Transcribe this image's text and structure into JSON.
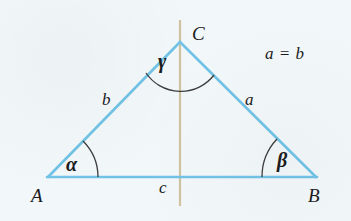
{
  "figure": {
    "type": "geometry-diagram",
    "background_color": "#f2f7fa"
  },
  "colors": {
    "triangle_stroke": "#71c3e6",
    "axis_stroke": "#cfc3a0",
    "arc_stroke": "#3d3d3d",
    "text": "#1c1c1c"
  },
  "vertices": [
    {
      "name": "A",
      "label": "A",
      "x": 48,
      "y": 177
    },
    {
      "name": "B",
      "label": "B",
      "x": 316,
      "y": 177
    },
    {
      "name": "C",
      "label": "C",
      "x": 180,
      "y": 42
    }
  ],
  "sides": [
    {
      "name": "side-a",
      "label": "a",
      "from": "C",
      "to": "B",
      "label_x": 250,
      "label_y": 100
    },
    {
      "name": "side-b",
      "label": "b",
      "from": "A",
      "to": "C",
      "label_x": 107,
      "label_y": 100
    },
    {
      "name": "side-c",
      "label": "c",
      "from": "A",
      "to": "B",
      "label_x": 164,
      "label_y": 188
    }
  ],
  "angles": [
    {
      "name": "angle-alpha",
      "label": "α",
      "at_vertex": "A",
      "label_x": 75,
      "label_y": 165
    },
    {
      "name": "angle-beta",
      "label": "β",
      "at_vertex": "B",
      "label_x": 286,
      "label_y": 161
    },
    {
      "name": "angle-gamma",
      "label": "γ",
      "at_vertex": "C",
      "label_x": 167,
      "label_y": 62
    }
  ],
  "axis": {
    "name": "axis-of-symmetry",
    "x": 180,
    "y_top": 20,
    "y_bottom": 206
  },
  "annotations": [
    {
      "name": "relation",
      "text": "a = b",
      "x": 290,
      "y": 55
    }
  ]
}
